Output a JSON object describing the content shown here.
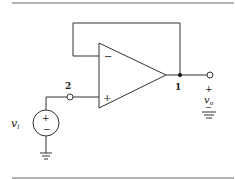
{
  "diagram": {
    "type": "circuit",
    "components": [
      {
        "id": "opamp",
        "type": "operational-amplifier",
        "inputs": {
          "inverting": "-",
          "non_inverting": "+"
        }
      },
      {
        "id": "vi",
        "type": "voltage-source",
        "label": "v_i",
        "polarity": {
          "top": "+",
          "bottom": "−"
        }
      },
      {
        "id": "ground_source",
        "type": "ground"
      },
      {
        "id": "ground_output",
        "type": "ground"
      }
    ],
    "nodes": [
      {
        "id": "1",
        "label": "1",
        "description": "op-amp output, fed back to inverting input"
      },
      {
        "id": "2",
        "label": "2",
        "description": "non-inverting input terminal"
      }
    ],
    "labels": {
      "minus_sign": "−",
      "plus_sign": "+",
      "node1": "1",
      "node2": "2",
      "vi_base": "v",
      "vi_sub": "i",
      "vo_base": "v",
      "vo_sub": "o",
      "vo_plus": "+",
      "vo_minus": "−",
      "src_plus": "+",
      "src_minus": "−"
    },
    "colors": {
      "stroke": "#333333",
      "background": "#ffffff",
      "rule": "#555555"
    }
  }
}
